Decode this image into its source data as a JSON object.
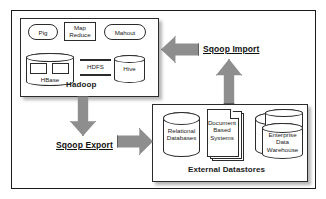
{
  "diagram": {
    "colors": {
      "arrow_fill": "#8e8e8e",
      "arrow_stroke": "#5d5d5d",
      "shape_stroke": "#2b2b2b",
      "shape_fill": "#ffffff",
      "frame_stroke": "#1a1a1a",
      "text": "#1a1a1a"
    }
  },
  "hadoop": {
    "label": "Hadoop",
    "components": [
      {
        "name": "Pig",
        "shape": "rounded-rectangle"
      },
      {
        "name": "Map\nReduce",
        "shape": "rectangle"
      },
      {
        "name": "Mahout",
        "shape": "rounded-rectangle"
      },
      {
        "name": "HBase",
        "shape": "cylinder"
      },
      {
        "name": "HDFS",
        "shape": "banded-text"
      },
      {
        "name": "Hive",
        "shape": "cylinder"
      }
    ]
  },
  "datastores": {
    "label": "External Datastores",
    "components": [
      {
        "name": "Relational\nDatabases",
        "shape": "cylinder"
      },
      {
        "name": "Document\nBased\nSystems",
        "shape": "document-stack"
      },
      {
        "name": "Enterprise\nData\nWarehouse",
        "shape": "cylinder-stack"
      }
    ]
  },
  "flows": {
    "import_label": "Sqoop Import",
    "export_label": "Sqoop Export"
  }
}
